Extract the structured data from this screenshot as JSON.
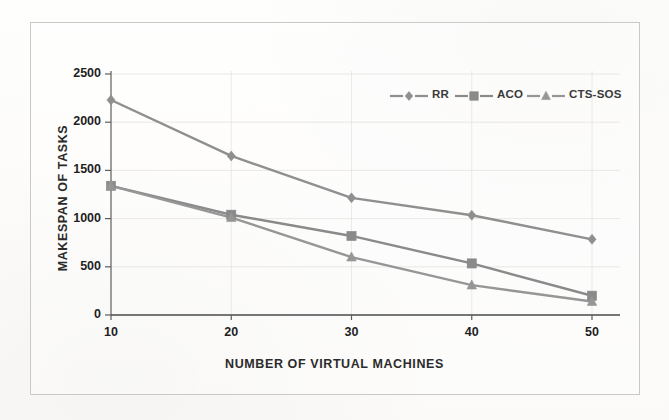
{
  "figure": {
    "background_color": "#fdfdfc",
    "border_color": "#c9c9c5",
    "ink_color": "#8a8a8a",
    "text_color": "#1f1f1f"
  },
  "chart_data": {
    "type": "line",
    "title": "",
    "xlabel": "NUMBER OF VIRTUAL MACHINES",
    "ylabel": "MAKESPAN  OF TASKS",
    "categories": [
      10,
      20,
      30,
      40,
      50
    ],
    "x": [
      10,
      20,
      30,
      40,
      50
    ],
    "xtick_labels": [
      "10",
      "20",
      "30",
      "40",
      "50"
    ],
    "ytick_labels": [
      "0",
      "500",
      "1000",
      "1500",
      "2000",
      "2500"
    ],
    "yticks": [
      0,
      500,
      1000,
      1500,
      2000,
      2500
    ],
    "ylim": [
      0,
      2500
    ],
    "xlim": [
      10,
      50
    ],
    "grid": true,
    "legend_position": "upper right",
    "series": [
      {
        "name": "RR",
        "marker": "diamond",
        "color": "#8f8f8f",
        "values": [
          2230,
          1650,
          1215,
          1035,
          785
        ]
      },
      {
        "name": "ACO",
        "marker": "square",
        "color": "#8a8a8a",
        "values": [
          1340,
          1040,
          820,
          535,
          200
        ]
      },
      {
        "name": "CTS-SOS",
        "marker": "triangle",
        "color": "#969696",
        "values": [
          1340,
          1010,
          600,
          310,
          140
        ]
      }
    ]
  },
  "legend": {
    "items": [
      {
        "label": "RR",
        "marker": "diamond"
      },
      {
        "label": "ACO",
        "marker": "square"
      },
      {
        "label": "CTS-SOS",
        "marker": "triangle"
      }
    ]
  }
}
